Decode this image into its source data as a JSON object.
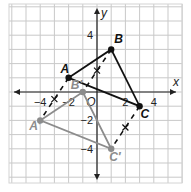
{
  "figure": {
    "axes": {
      "x_label": "x",
      "y_label": "y",
      "origin_label": "O",
      "x_ticks": [
        {
          "value": -4,
          "label": "−4"
        },
        {
          "value": -2,
          "label": "−2"
        },
        {
          "value": 2,
          "label": "2"
        },
        {
          "value": 4,
          "label": "4"
        }
      ],
      "y_ticks": [
        {
          "value": 4,
          "label": "4"
        },
        {
          "value": -2,
          "label": "−2"
        },
        {
          "value": -4,
          "label": "−4"
        }
      ],
      "xlim": [
        -6.2,
        6
      ],
      "ylim": [
        -6.3,
        6.2
      ],
      "grid": true,
      "grid_step": 1
    },
    "original_triangle": {
      "color": "#111111",
      "vertices": [
        {
          "label": "A",
          "x": -2,
          "y": 1
        },
        {
          "label": "B",
          "x": 1,
          "y": 3
        },
        {
          "label": "C",
          "x": 3,
          "y": -1
        }
      ]
    },
    "image_triangle": {
      "color": "#8c8c8c",
      "vertices": [
        {
          "label": "A′",
          "x": -4,
          "y": -2
        },
        {
          "label": "B′",
          "x": -1,
          "y": 0
        },
        {
          "label": "C′",
          "x": 1,
          "y": -4
        }
      ]
    },
    "connector_segments": [
      {
        "from": "A",
        "to": "A′",
        "style": "dashed",
        "mark": "x"
      },
      {
        "from": "B",
        "to": "B′",
        "style": "dashed",
        "mark": "x"
      },
      {
        "from": "C",
        "to": "C′",
        "style": "dashed",
        "mark": "x"
      }
    ]
  }
}
